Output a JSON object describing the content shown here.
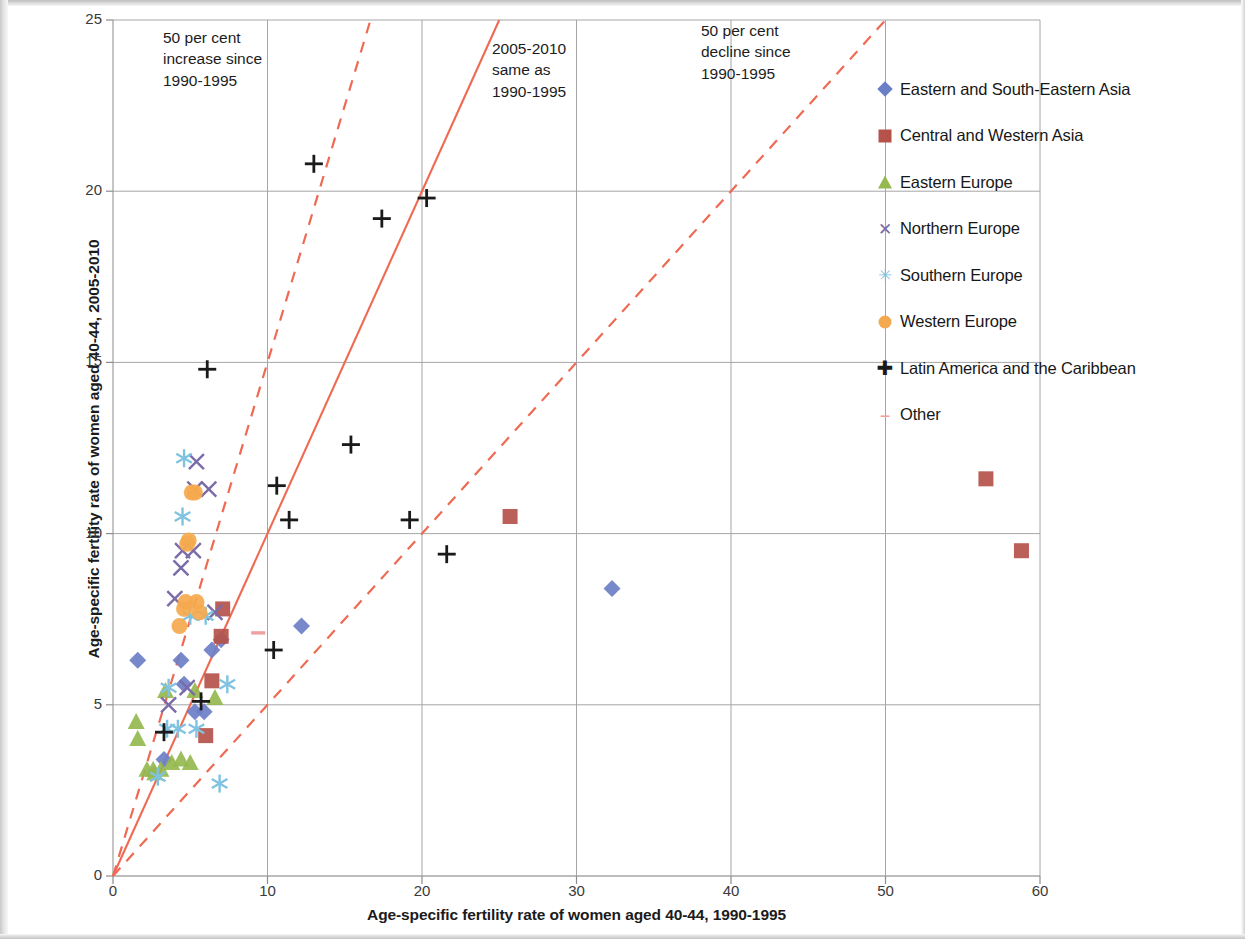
{
  "chart_data": {
    "type": "scatter",
    "title": "",
    "xlabel": "Age-specific fertility rate of women aged 40-44, 1990-1995",
    "ylabel": "Age-specific fertility rate of women aged 40-44, 2005-2010",
    "xlim": [
      0,
      60
    ],
    "ylim": [
      0,
      25
    ],
    "xticks": [
      0,
      10,
      20,
      30,
      40,
      50,
      60
    ],
    "yticks": [
      0,
      5,
      10,
      15,
      20,
      25
    ],
    "grid": true,
    "legend_position": "right",
    "annotations": [
      {
        "id": "increase",
        "text": "50 per cent\nincrease since\n1990-1995"
      },
      {
        "id": "same",
        "text": "2005-2010\nsame as\n1990-1995"
      },
      {
        "id": "decline",
        "text": "50 per cent\ndecline since\n1990-1995"
      }
    ],
    "reference_lines": [
      {
        "name": "50 per cent increase since 1990-1995",
        "slope": 1.5,
        "style": "dashed",
        "color": "#ef6a53"
      },
      {
        "name": "2005-2010 same as 1990-1995",
        "slope": 1.0,
        "style": "solid",
        "color": "#ef6a53"
      },
      {
        "name": "50 per cent decline since 1990-1995",
        "slope": 0.5,
        "style": "dashed",
        "color": "#ef6a53"
      }
    ],
    "series": [
      {
        "name": "Eastern and South-Eastern Asia",
        "marker": "diamond",
        "color": "#6b7fc7",
        "points": [
          [
            1.6,
            6.3
          ],
          [
            3.3,
            3.4
          ],
          [
            4.4,
            6.3
          ],
          [
            4.6,
            5.6
          ],
          [
            5.3,
            4.8
          ],
          [
            5.9,
            4.8
          ],
          [
            6.4,
            6.6
          ],
          [
            7.0,
            6.9
          ],
          [
            12.2,
            7.3
          ],
          [
            32.3,
            8.4
          ]
        ]
      },
      {
        "name": "Central and Western Asia",
        "marker": "square",
        "color": "#b5534a",
        "points": [
          [
            6.0,
            4.1
          ],
          [
            6.4,
            5.7
          ],
          [
            7.0,
            7.0
          ],
          [
            7.1,
            7.8
          ],
          [
            25.7,
            10.5
          ],
          [
            56.5,
            11.6
          ],
          [
            58.8,
            9.5
          ]
        ]
      },
      {
        "name": "Eastern Europe",
        "marker": "triangle",
        "color": "#95b84f",
        "points": [
          [
            1.5,
            4.5
          ],
          [
            1.6,
            4.0
          ],
          [
            2.2,
            3.1
          ],
          [
            2.6,
            3.1
          ],
          [
            2.7,
            3.0
          ],
          [
            3.1,
            3.1
          ],
          [
            3.4,
            5.4
          ],
          [
            3.8,
            3.3
          ],
          [
            4.4,
            3.4
          ],
          [
            5.0,
            3.3
          ],
          [
            5.3,
            5.4
          ],
          [
            6.6,
            5.2
          ]
        ]
      },
      {
        "name": "Northern Europe",
        "marker": "x",
        "color": "#7b6ba8",
        "points": [
          [
            3.6,
            5.0
          ],
          [
            4.0,
            8.1
          ],
          [
            4.4,
            9.0
          ],
          [
            4.5,
            9.5
          ],
          [
            4.8,
            5.5
          ],
          [
            5.2,
            9.5
          ],
          [
            5.3,
            11.3
          ],
          [
            5.4,
            12.1
          ],
          [
            6.2,
            11.3
          ],
          [
            6.6,
            7.7
          ]
        ]
      },
      {
        "name": "Southern Europe",
        "marker": "asterisk",
        "color": "#7fc3e0",
        "points": [
          [
            2.9,
            2.9
          ],
          [
            3.5,
            4.3
          ],
          [
            3.6,
            5.5
          ],
          [
            4.2,
            4.3
          ],
          [
            4.5,
            10.5
          ],
          [
            4.6,
            12.2
          ],
          [
            5.0,
            7.6
          ],
          [
            5.4,
            4.3
          ],
          [
            6.0,
            7.6
          ],
          [
            6.9,
            2.7
          ],
          [
            7.4,
            5.6
          ]
        ]
      },
      {
        "name": "Western Europe",
        "marker": "circle",
        "color": "#f5a94e",
        "points": [
          [
            4.3,
            7.3
          ],
          [
            4.6,
            7.8
          ],
          [
            4.7,
            8.0
          ],
          [
            4.8,
            9.7
          ],
          [
            4.9,
            9.8
          ],
          [
            5.1,
            11.2
          ],
          [
            5.3,
            11.2
          ],
          [
            5.4,
            8.0
          ],
          [
            5.6,
            7.7
          ]
        ]
      },
      {
        "name": "Latin America and the Caribbean",
        "marker": "plus",
        "color": "#1a1a1a",
        "points": [
          [
            3.3,
            4.2
          ],
          [
            5.7,
            5.1
          ],
          [
            6.1,
            14.8
          ],
          [
            10.4,
            6.6
          ],
          [
            10.6,
            11.4
          ],
          [
            11.4,
            10.4
          ],
          [
            13.0,
            20.8
          ],
          [
            15.4,
            12.6
          ],
          [
            17.4,
            19.2
          ],
          [
            19.2,
            10.4
          ],
          [
            20.3,
            19.8
          ],
          [
            21.6,
            9.4
          ]
        ]
      },
      {
        "name": "Other",
        "marker": "dash",
        "color": "#f0a0a0",
        "points": [
          [
            9.4,
            7.1
          ]
        ]
      }
    ]
  },
  "axes": {
    "x_ticks": [
      "0",
      "10",
      "20",
      "30",
      "40",
      "50",
      "60"
    ],
    "y_ticks": [
      "0",
      "5",
      "10",
      "15",
      "20",
      "25"
    ],
    "x_title": "Age-specific fertility rate of women aged 40-44, 1990-1995",
    "y_title": "Age-specific fertility rate of women aged 40-44, 2005-2010"
  },
  "annotations": {
    "increase": "50 per cent\nincrease since\n1990-1995",
    "same": "2005-2010\nsame as\n1990-1995",
    "decline": "50 per cent\ndecline since\n1990-1995"
  },
  "legend": {
    "items": [
      {
        "label": "Eastern and South-Eastern Asia",
        "marker": "diamond",
        "color": "#6b7fc7"
      },
      {
        "label": "Central and Western Asia",
        "marker": "square",
        "color": "#b5534a"
      },
      {
        "label": "Eastern Europe",
        "marker": "triangle",
        "color": "#95b84f"
      },
      {
        "label": "Northern Europe",
        "marker": "x",
        "color": "#7b6ba8"
      },
      {
        "label": "Southern Europe",
        "marker": "asterisk",
        "color": "#7fc3e0"
      },
      {
        "label": "Western Europe",
        "marker": "circle",
        "color": "#f5a94e"
      },
      {
        "label": "Latin America and the Caribbean",
        "marker": "plus",
        "color": "#1a1a1a"
      },
      {
        "label": "Other",
        "marker": "dash",
        "color": "#f0a0a0"
      }
    ]
  },
  "colors": {
    "reference_line": "#ef6a53",
    "grid": "#a6a6a6",
    "axis": "#8d8d8d",
    "text": "#1b1b1b"
  }
}
